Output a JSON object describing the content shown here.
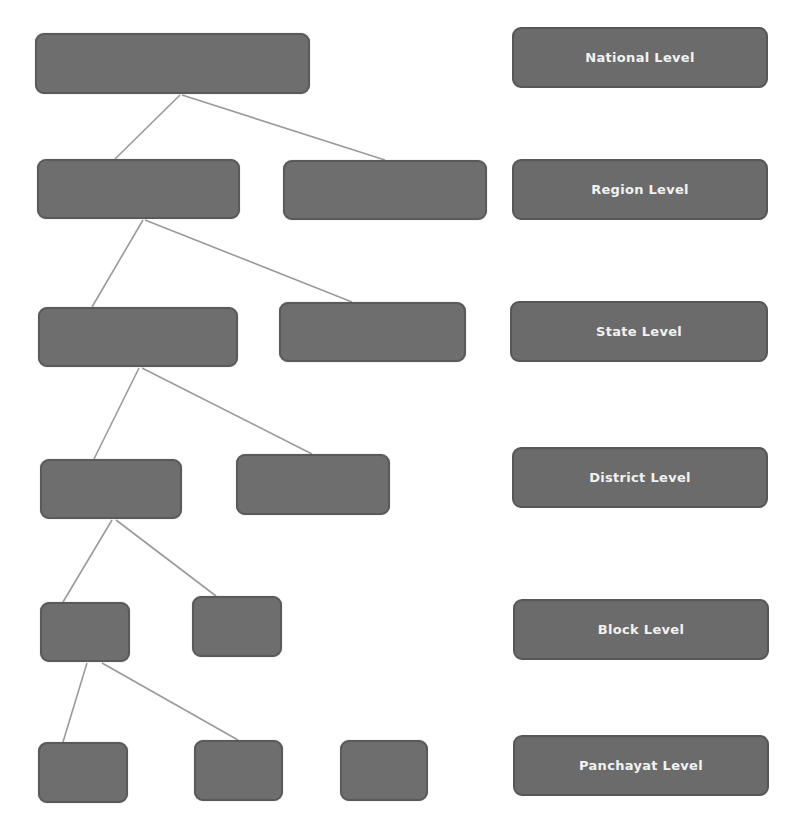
{
  "diagram": {
    "type": "hierarchy",
    "colors": {
      "node_fill": "#6e6e6e",
      "node_border": "#5a5a5a",
      "connector": "#9a9a9a",
      "label_text": "#f2f2f2",
      "background": "#ffffff"
    },
    "levels": [
      {
        "label": "National Level"
      },
      {
        "label": "Region Level"
      },
      {
        "label": "State Level"
      },
      {
        "label": "District Level"
      },
      {
        "label": "Block Level"
      },
      {
        "label": "Panchayat Level"
      }
    ],
    "nodes": [
      {
        "id": "national",
        "level": 0,
        "text": ""
      },
      {
        "id": "region-1",
        "level": 1,
        "text": "",
        "parent": "national"
      },
      {
        "id": "region-2",
        "level": 1,
        "text": "",
        "parent": "national"
      },
      {
        "id": "state-1",
        "level": 2,
        "text": "",
        "parent": "region-1"
      },
      {
        "id": "state-2",
        "level": 2,
        "text": "",
        "parent": "region-1"
      },
      {
        "id": "district-1",
        "level": 3,
        "text": "",
        "parent": "state-1"
      },
      {
        "id": "district-2",
        "level": 3,
        "text": "",
        "parent": "state-1"
      },
      {
        "id": "block-1",
        "level": 4,
        "text": "",
        "parent": "district-1"
      },
      {
        "id": "block-2",
        "level": 4,
        "text": "",
        "parent": "district-1"
      },
      {
        "id": "panchayat-1",
        "level": 5,
        "text": "",
        "parent": "block-1"
      },
      {
        "id": "panchayat-2",
        "level": 5,
        "text": "",
        "parent": "block-1"
      },
      {
        "id": "panchayat-3",
        "level": 5,
        "text": ""
      }
    ]
  }
}
